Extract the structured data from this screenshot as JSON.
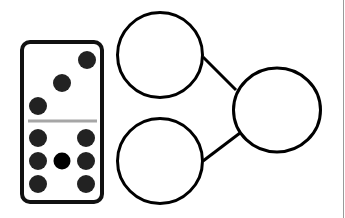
{
  "diagram": {
    "title": "Domino number bond",
    "type": "part-part-whole",
    "colors": {
      "background": "#ffffff",
      "stroke": "#000000",
      "pip": "#222222",
      "center_pip": "#000000",
      "divider": "#a6a6a6",
      "page_edge": "#9a9a9a"
    },
    "domino": {
      "top_half": {
        "pips": 3
      },
      "bottom_half": {
        "pips": 7
      }
    },
    "bond": {
      "part_top": {
        "value": ""
      },
      "part_bottom": {
        "value": ""
      },
      "whole": {
        "value": ""
      }
    }
  }
}
